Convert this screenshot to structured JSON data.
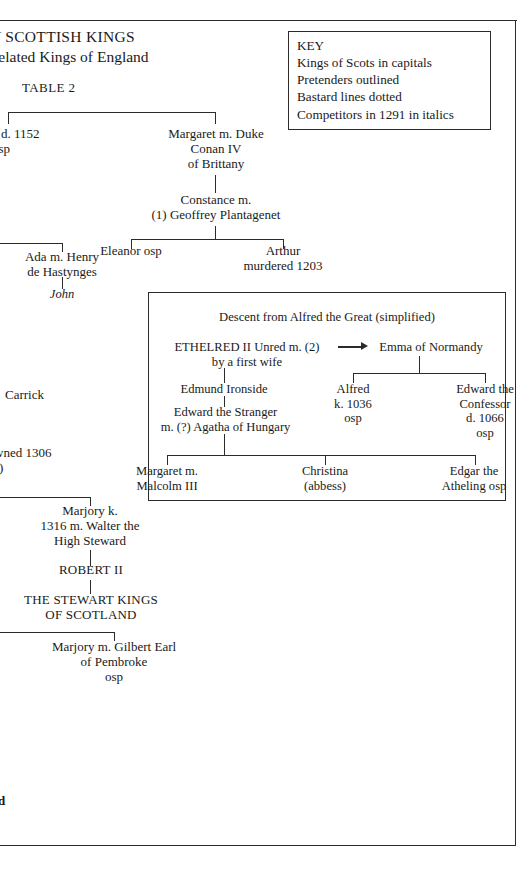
{
  "page": {
    "title_line_1": "LY SCOTTISH KINGS",
    "title_line_2": "Related Kings of England",
    "table_label": "TABLE 2"
  },
  "key": {
    "heading": "KEY",
    "lines": [
      "Kings of Scots in capitals",
      "Pretenders outlined",
      "Bastard lines dotted",
      "Competitors in 1291 in italics"
    ]
  },
  "tree": {
    "ada_1152": "a d. 1152\nosp",
    "margaret_conan": "Margaret m. Duke\nConan IV\nof Brittany",
    "constance": "Constance m.\n(1) Geoffrey Plantagenet",
    "eleanor": "Eleanor osp",
    "arthur": "Arthur\nmurdered 1203",
    "ada_hastynges": "Ada m. Henry\nde Hastynges",
    "john": "John",
    "carrick": "Carrick",
    "crowned_1306": "wned 1306",
    "crowned_1306_sub": "s)",
    "marjory_walter": "Marjory k.\n1316 m. Walter the\nHigh Steward",
    "robert_ii": "ROBERT II",
    "stewart_kings": "THE STEWART KINGS\nOF SCOTLAND",
    "marjory_pembroke": "Marjory m. Gilbert Earl\nof Pembroke\nosp",
    "bottom_fragment": "d"
  },
  "alfred_box": {
    "title": "Descent from Alfred the Great (simplified)",
    "ethelred": "ETHELRED II Unred m. (2)",
    "ethelred_sub": "by a first wife",
    "emma": "Emma of Normandy",
    "edmund": "Edmund Ironside",
    "edward_stranger": "Edward the Stranger\nm. (?) Agatha of Hungary",
    "alfred": "Alfred\nk. 1036\nosp",
    "edward_confessor": "Edward the\nConfessor\nd. 1066\nosp",
    "margaret_malcolm": "Margaret m.\nMalcolm III",
    "christina": "Christina\n(abbess)",
    "edgar": "Edgar the\nAtheling osp"
  }
}
